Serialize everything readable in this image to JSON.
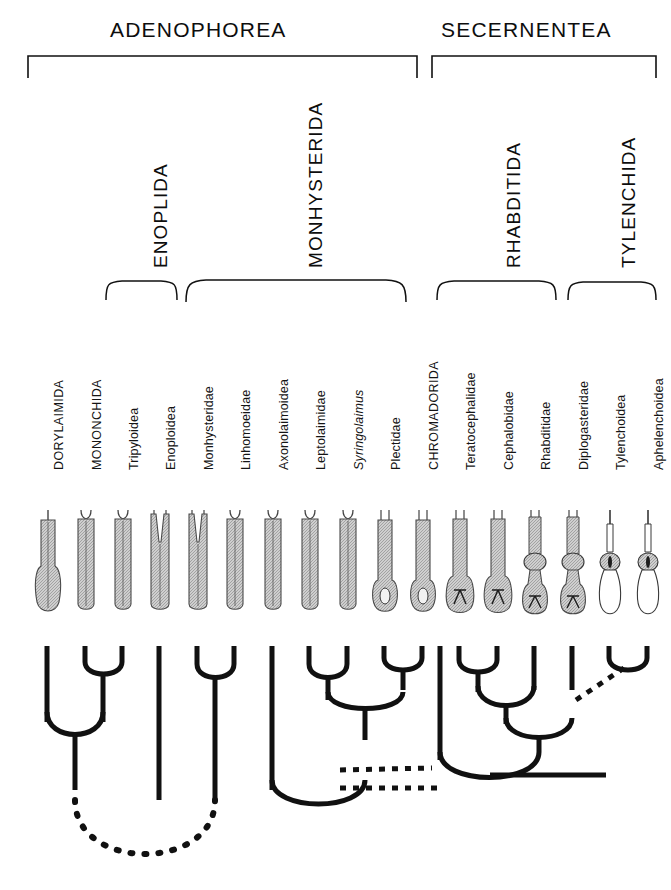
{
  "figure": {
    "type": "cladogram",
    "classes": [
      {
        "name": "ADENOPHOREA",
        "bracket": {
          "x1": 28,
          "x2": 417
        },
        "label_x": 222,
        "label_y": 22
      },
      {
        "name": "SECERNENTEA",
        "bracket": {
          "x1": 432,
          "x2": 656
        },
        "label_x": 544,
        "label_y": 22
      }
    ],
    "orders": [
      {
        "name": "ENOPLIDA",
        "brace": {
          "x1": 106,
          "x2": 177
        },
        "label_x": 146,
        "label_y": 268
      },
      {
        "name": "MONHYSTERIDA",
        "brace": {
          "x1": 186,
          "x2": 406
        },
        "label_x": 300,
        "label_y": 268
      },
      {
        "name": "RHABDITIDA",
        "brace": {
          "x1": 437,
          "x2": 556
        },
        "label_x": 500,
        "label_y": 268
      },
      {
        "name": "TYLENCHIDA",
        "brace": {
          "x1": 568,
          "x2": 656
        },
        "label_x": 616,
        "label_y": 268
      }
    ],
    "taxa": [
      {
        "name": "DORYLAIMIDA",
        "style": "caps",
        "x": 47,
        "pharynx": "dorylaimid-swollen-base"
      },
      {
        "name": "MONONCHIDA",
        "style": "caps",
        "x": 85,
        "pharynx": "mononchid-cylindrical"
      },
      {
        "name": "Tripyloidea",
        "style": "normal",
        "x": 122,
        "pharynx": "tripyloid-cylindrical"
      },
      {
        "name": "Enoploidea",
        "style": "normal",
        "x": 159,
        "pharynx": "enoploid-split"
      },
      {
        "name": "Monhysteridae",
        "style": "normal",
        "x": 197,
        "pharynx": "monhysterid-split"
      },
      {
        "name": "Linhomoeidae",
        "style": "normal",
        "x": 234,
        "pharynx": "linhomoeid-cylindrical"
      },
      {
        "name": "Axonolaimoidea",
        "style": "normal",
        "x": 272,
        "pharynx": "axonolaimoid-cylindrical"
      },
      {
        "name": "Leptolaimidae",
        "style": "normal",
        "x": 309,
        "pharynx": "leptolaimid-cylindrical"
      },
      {
        "name": "Syringolaimus",
        "style": "italic",
        "x": 347,
        "pharynx": "syringolaimus-slender"
      },
      {
        "name": "Plectidae",
        "style": "normal",
        "x": 384,
        "pharynx": "plectid-valved-bulb"
      },
      {
        "name": "CHROMADORIDA",
        "style": "caps",
        "x": 422,
        "pharynx": "chromadorid-bulb"
      },
      {
        "name": "Teratocephalidae",
        "style": "normal",
        "x": 459,
        "pharynx": "teratocephalid-valve"
      },
      {
        "name": "Cephalobidae",
        "style": "normal",
        "x": 497,
        "pharynx": "cephalobid-valve"
      },
      {
        "name": "Rhabditidae",
        "style": "normal",
        "x": 534,
        "pharynx": "rhabditid-median-bulb"
      },
      {
        "name": "Diplogasteridae",
        "style": "normal",
        "x": 572,
        "pharynx": "diplogasterid-median-bulb"
      },
      {
        "name": "Tylenchoidea",
        "style": "normal",
        "x": 609,
        "pharynx": "tylenchoid-stylet"
      },
      {
        "name": "Aphelenchoidea",
        "style": "normal",
        "x": 647,
        "pharynx": "aphelenchoid-stylet"
      }
    ],
    "tree": {
      "solid_clades": [
        {
          "members": [
            "MONONCHIDA",
            "Tripyloidea"
          ]
        },
        {
          "members": [
            "DORYLAIMIDA",
            "MONONCHIDA+Tripyloidea"
          ]
        },
        {
          "members": [
            "Monhysteridae",
            "Linhomoeidae"
          ]
        },
        {
          "members": [
            "Leptolaimidae",
            "Syringolaimus"
          ]
        },
        {
          "members": [
            "Plectidae",
            "CHROMADORIDA"
          ]
        },
        {
          "members": [
            "Teratocephalidae",
            "Cephalobidae"
          ]
        },
        {
          "members": [
            "Rhabditidae",
            "Diplogasteridae"
          ]
        }
      ],
      "dashed_links": [
        {
          "note": "uncertain link between Adenophorea clade and Secernentea lineage"
        },
        {
          "note": "uncertain link to Tylenchida clade"
        },
        {
          "note": "uncertain basal link joining Enoplida and Monhysterida stems"
        }
      ]
    }
  }
}
